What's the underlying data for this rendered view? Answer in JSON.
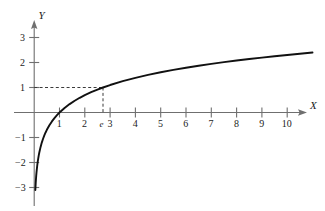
{
  "chart_data": {
    "type": "line",
    "title": "",
    "subtitle": "",
    "xlabel": "X",
    "ylabel": "Y",
    "function": "y = ln(x)",
    "xlim": [
      -0.35,
      11.5
    ],
    "ylim": [
      -3.3,
      3.4
    ],
    "grid": false,
    "legend": null,
    "x_ticks": [
      1,
      2,
      3,
      4,
      5,
      6,
      7,
      8,
      9,
      10
    ],
    "x_tick_labels": [
      "1",
      "2",
      "3",
      "4",
      "5",
      "6",
      "7",
      "8",
      "9",
      "10"
    ],
    "y_ticks": [
      -3,
      -2,
      -1,
      1,
      2,
      3
    ],
    "y_tick_labels": [
      "−3",
      "−2",
      "−1",
      "1",
      "2",
      "3"
    ],
    "special_marks": [
      {
        "name": "e-marker",
        "x_label": "e",
        "x_value": 2.71828,
        "y_value": 1,
        "guide_style": "dashed",
        "description": "dashed lines from y=1 on the Y axis to the curve at x=e and down to the X axis"
      }
    ],
    "series": [
      {
        "name": "ln(x)",
        "color": "#111111",
        "x": [
          0.045,
          0.05,
          0.06,
          0.07,
          0.08,
          0.09,
          0.1,
          0.12,
          0.14,
          0.16,
          0.18,
          0.2,
          0.25,
          0.3,
          0.35,
          0.4,
          0.45,
          0.5,
          0.6,
          0.7,
          0.8,
          0.9,
          1.0,
          1.2,
          1.4,
          1.6,
          1.8,
          2.0,
          2.25,
          2.5,
          2.71828,
          3.0,
          3.5,
          4.0,
          4.5,
          5.0,
          5.5,
          6.0,
          6.5,
          7.0,
          7.5,
          8.0,
          8.5,
          9.0,
          9.5,
          10.0,
          10.5,
          11.0
        ],
        "y": [
          -3.101,
          -2.996,
          -2.813,
          -2.659,
          -2.526,
          -2.408,
          -2.303,
          -2.12,
          -1.966,
          -1.833,
          -1.715,
          -1.609,
          -1.386,
          -1.204,
          -1.05,
          -0.916,
          -0.799,
          -0.693,
          -0.511,
          -0.357,
          -0.223,
          -0.105,
          0.0,
          0.182,
          0.336,
          0.47,
          0.588,
          0.693,
          0.811,
          0.916,
          1.0,
          1.099,
          1.253,
          1.386,
          1.504,
          1.609,
          1.705,
          1.792,
          1.872,
          1.946,
          2.015,
          2.079,
          2.14,
          2.197,
          2.251,
          2.303,
          2.351,
          2.398
        ]
      }
    ]
  },
  "figure": {
    "background_color": "#ffffff",
    "axis_color": "#6f6f6f",
    "curve_color": "#111111",
    "guide_color": "#3a3a3a"
  },
  "axes": {
    "x_axis_label": "X",
    "y_axis_label": "Y"
  },
  "labels": {
    "x": [
      "1",
      "2",
      "3",
      "4",
      "5",
      "6",
      "7",
      "8",
      "9",
      "10"
    ],
    "y": [
      "3",
      "2",
      "1",
      "−1",
      "−2",
      "−3"
    ],
    "e": "e"
  }
}
